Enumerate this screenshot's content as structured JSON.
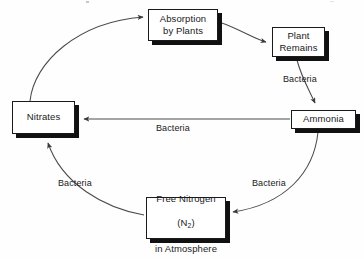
{
  "diagram": {
    "type": "cycle-diagram",
    "background_color": "#fefefe",
    "box_border_color": "#1a1a1a",
    "box_fill_color": "#ffffff",
    "shadow_color": "#111111",
    "arrow_color": "#4a4a4a",
    "text_color": "#1a1a1a",
    "nodes": [
      {
        "id": "absorption",
        "label": "Absorption\nby Plants"
      },
      {
        "id": "plant_remains",
        "label": "Plant\nRemains"
      },
      {
        "id": "ammonia",
        "label": "Ammonia"
      },
      {
        "id": "nitrates",
        "label": "Nitrates"
      },
      {
        "id": "free_nitrogen",
        "line1": "Free Nitrogen",
        "line2_pre": "(N",
        "line2_sub": "2",
        "line2_post": ")",
        "line3": "in Atmosphere"
      }
    ],
    "edges": [
      {
        "id": "nitrates_to_absorption",
        "from": "nitrates",
        "to": "absorption",
        "label": ""
      },
      {
        "id": "absorption_to_plant_remains",
        "from": "absorption",
        "to": "plant_remains",
        "label": ""
      },
      {
        "id": "plant_remains_to_ammonia",
        "from": "plant_remains",
        "to": "ammonia",
        "label": "Bacteria"
      },
      {
        "id": "ammonia_to_nitrates",
        "from": "ammonia",
        "to": "nitrates",
        "label": "Bacteria"
      },
      {
        "id": "ammonia_to_free_nitrogen",
        "from": "ammonia",
        "to": "free_nitrogen",
        "label": "Bacteria"
      },
      {
        "id": "free_nitrogen_to_nitrates",
        "from": "free_nitrogen",
        "to": "nitrates",
        "label": "Bacteria"
      }
    ]
  }
}
